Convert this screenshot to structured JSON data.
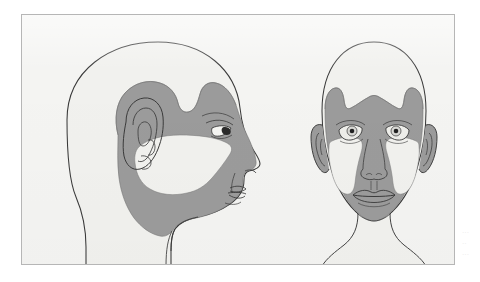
{
  "figure": {
    "panel": {
      "border_color": "#b6b6b6",
      "background_color": "#f4f4f2"
    },
    "colors": {
      "skin_unshaded": "#f1f1ee",
      "shaded_region": "#9b9b9b",
      "outline": "#3a3a3a",
      "pupil": "#222222",
      "iris": "#d8d8d4",
      "page_background": "#ffffff"
    },
    "views": [
      {
        "id": "lateral-profile",
        "label": "Lateral profile view",
        "facing": "right",
        "parts": [
          {
            "name": "cranium",
            "shaded": false
          },
          {
            "name": "temporal-region",
            "shaded": true
          },
          {
            "name": "ear",
            "shaded": true
          },
          {
            "name": "periorbital-region",
            "shaded": true
          },
          {
            "name": "malar-cheek-pad",
            "shaded": false
          },
          {
            "name": "nose",
            "shaded": false
          },
          {
            "name": "lips",
            "shaded": false
          },
          {
            "name": "mandible-jaw",
            "shaded": true
          },
          {
            "name": "chin",
            "shaded": true
          },
          {
            "name": "neck",
            "shaded": false
          }
        ]
      },
      {
        "id": "frontal",
        "label": "Frontal view",
        "facing": "forward",
        "parts": [
          {
            "name": "upper-forehead",
            "shaded": false
          },
          {
            "name": "lower-forehead-band",
            "shaded": true
          },
          {
            "name": "temporal-projections",
            "shaded": true
          },
          {
            "name": "left-eye",
            "shaded": true
          },
          {
            "name": "right-eye",
            "shaded": true
          },
          {
            "name": "left-ear",
            "shaded": true
          },
          {
            "name": "right-ear",
            "shaded": true
          },
          {
            "name": "left-malar-cheek-pad",
            "shaded": false
          },
          {
            "name": "right-malar-cheek-pad",
            "shaded": false
          },
          {
            "name": "nose",
            "shaded": true
          },
          {
            "name": "lips",
            "shaded": true
          },
          {
            "name": "perioral-chin-region",
            "shaded": true
          },
          {
            "name": "neck",
            "shaded": false
          }
        ]
      }
    ],
    "edge_caption_lines": [
      "···",
      "··",
      "···"
    ]
  }
}
